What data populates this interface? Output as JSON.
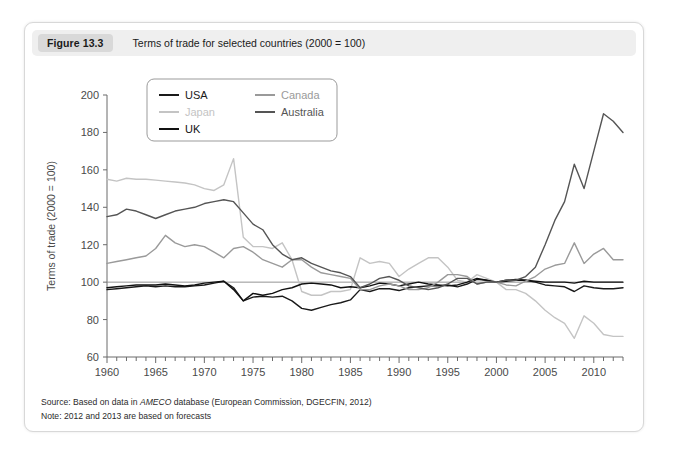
{
  "figure": {
    "number_label": "Figure 13.3",
    "title": "Terms of trade for selected countries (2000 = 100)",
    "source_prefix": "Source: Based on data in ",
    "source_italic": "AMECO",
    "source_suffix": " database (European Commission, DGECFIN, 2012)",
    "note": "Note: 2012 and 2013 are based on forecasts"
  },
  "colors": {
    "usa": "#1a1a1a",
    "japan": "#c4c4c4",
    "uk": "#111111",
    "canada": "#9a9a9a",
    "australia": "#555555",
    "axis": "#6b6b6b",
    "card_border": "#d8d8d8",
    "header_bg": "#efefef",
    "badge_bg": "#d9d9d9"
  },
  "chart_data": {
    "type": "line",
    "title": "Terms of trade for selected countries (2000 = 100)",
    "xlabel": "",
    "ylabel": "Terms of trade (2000 = 100)",
    "xlim": [
      1960,
      2013
    ],
    "ylim": [
      60,
      200
    ],
    "yticks": [
      60,
      80,
      100,
      120,
      140,
      160,
      180,
      200
    ],
    "xticks": [
      1960,
      1965,
      1970,
      1975,
      1980,
      1985,
      1990,
      1995,
      2000,
      2005,
      2010
    ],
    "xtick_minor_step": 1,
    "grid": false,
    "reference_line": 100,
    "legend_position": "upper-left-inside",
    "x": [
      1960,
      1961,
      1962,
      1963,
      1964,
      1965,
      1966,
      1967,
      1968,
      1969,
      1970,
      1971,
      1972,
      1973,
      1974,
      1975,
      1976,
      1977,
      1978,
      1979,
      1980,
      1981,
      1982,
      1983,
      1984,
      1985,
      1986,
      1987,
      1988,
      1989,
      1990,
      1991,
      1992,
      1993,
      1994,
      1995,
      1996,
      1997,
      1998,
      1999,
      2000,
      2001,
      2002,
      2003,
      2004,
      2005,
      2006,
      2007,
      2008,
      2009,
      2010,
      2011,
      2012,
      2013
    ],
    "series": [
      {
        "name": "USA",
        "color": "#1a1a1a",
        "values": [
          96,
          96.5,
          97,
          97.5,
          98,
          97.5,
          98,
          97.5,
          97.5,
          98,
          98.5,
          99.5,
          100.5,
          97,
          90,
          92,
          92.5,
          92,
          92.5,
          90,
          86,
          85,
          86.5,
          88,
          89,
          90.5,
          96,
          95,
          96.5,
          96.5,
          95.5,
          97,
          97.5,
          98,
          98,
          98.5,
          97.5,
          99,
          101.5,
          101,
          100,
          101,
          101.5,
          101,
          100,
          98.5,
          98,
          97.5,
          95,
          98,
          97,
          96.5,
          96.5,
          97
        ]
      },
      {
        "name": "Japan",
        "color": "#c4c4c4",
        "values": [
          155,
          154,
          155.5,
          155,
          155,
          154.5,
          154,
          153.5,
          153,
          152,
          150,
          149,
          152,
          166,
          124,
          119,
          119,
          118,
          121,
          112,
          95,
          93,
          93,
          95,
          95,
          96,
          113,
          110,
          111,
          110,
          103,
          107,
          110,
          113,
          113,
          108,
          101,
          100,
          104,
          102,
          100,
          96,
          96,
          94,
          90,
          85,
          81,
          78,
          70,
          82,
          78,
          72,
          71,
          71
        ]
      },
      {
        "name": "UK",
        "color": "#111111",
        "values": [
          97,
          97.5,
          98,
          98.5,
          98.5,
          98.5,
          99,
          98.5,
          98,
          98.5,
          99.5,
          100,
          100.5,
          96,
          90,
          94,
          93,
          94,
          96,
          97,
          99,
          99.5,
          99,
          98.5,
          97,
          97.5,
          97,
          98,
          99.5,
          99,
          98,
          99,
          100,
          99,
          98.5,
          98,
          98.5,
          100,
          102,
          101,
          100,
          100.5,
          101,
          101,
          100.5,
          100,
          100,
          100,
          99.5,
          100.5,
          100,
          100,
          100,
          100
        ]
      },
      {
        "name": "Canada",
        "color": "#9a9a9a",
        "values": [
          110,
          111,
          112,
          113,
          114,
          118,
          125,
          121,
          119,
          120,
          119,
          116,
          113,
          118,
          119,
          116,
          112,
          110,
          108,
          112,
          112,
          108,
          105,
          104,
          103,
          102,
          96,
          96,
          98,
          99,
          98,
          96,
          96,
          97,
          100,
          104,
          104,
          103,
          99,
          100,
          100,
          98.5,
          98,
          100.5,
          103,
          107,
          109,
          110,
          121,
          110,
          115,
          118,
          112,
          112
        ]
      },
      {
        "name": "Australia",
        "color": "#555555",
        "values": [
          135,
          136,
          139,
          138,
          136,
          134,
          136,
          138,
          139,
          140,
          142,
          143,
          144,
          143,
          137,
          131,
          128,
          120,
          115,
          112,
          113,
          110,
          108,
          106,
          105,
          103,
          97,
          99,
          102,
          103,
          101,
          98,
          97,
          96,
          97,
          99,
          102,
          102,
          99,
          100,
          100,
          101,
          101,
          103,
          108,
          120,
          133,
          143,
          163,
          150,
          170,
          190,
          186,
          180
        ]
      }
    ]
  },
  "legend": {
    "entries": [
      {
        "label": "USA",
        "color": "#1a1a1a"
      },
      {
        "label": "Japan",
        "color": "#c4c4c4"
      },
      {
        "label": "UK",
        "color": "#111111"
      },
      {
        "label": "Canada",
        "color": "#9a9a9a"
      },
      {
        "label": "Australia",
        "color": "#555555"
      }
    ]
  }
}
